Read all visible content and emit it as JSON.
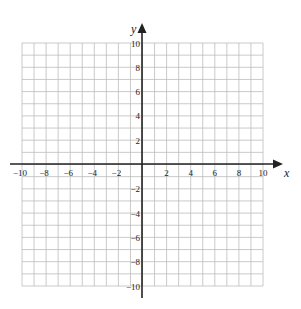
{
  "chart_data": {
    "type": "scatter",
    "title": "",
    "subtitle": "",
    "xlabel": "x",
    "ylabel": "y",
    "xlim": [
      -10,
      10
    ],
    "ylim": [
      -10,
      10
    ],
    "grid": true,
    "grid_step": 1,
    "x_ticks": [
      -10,
      -8,
      -6,
      -4,
      -2,
      2,
      4,
      6,
      8,
      10
    ],
    "y_ticks": [
      10,
      8,
      6,
      4,
      2,
      -2,
      -4,
      -6,
      -8,
      -10
    ],
    "x_tick_labels": [
      "−10",
      "−8",
      "−6",
      "−4",
      "−2",
      "2",
      "4",
      "6",
      "8",
      "10"
    ],
    "y_tick_labels": [
      "10",
      "8",
      "6",
      "4",
      "2",
      "−2",
      "−4",
      "−6",
      "−8",
      "−10"
    ],
    "series": [],
    "legend": null
  },
  "colors": {
    "grid": "#bdbdbd",
    "axis": "#222222",
    "background": "#ffffff"
  }
}
